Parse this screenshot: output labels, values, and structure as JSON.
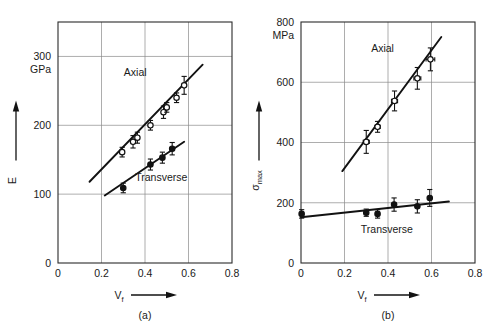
{
  "figure": {
    "background": "#ffffff",
    "ink": "#1a1a1a",
    "grid_color": "#8a8a8a"
  },
  "chart_data": [
    {
      "type": "scatter",
      "panel": "a",
      "caption": "(a)",
      "title": "",
      "xlabel": "V",
      "xlabel_sub": "f",
      "ylabel": "E",
      "ylabel_sub": "",
      "yunit": "GPa",
      "xlim": [
        0,
        0.8
      ],
      "ylim": [
        0,
        350
      ],
      "xticks": [
        0,
        0.2,
        0.4,
        0.6,
        0.8
      ],
      "xticklabels": [
        "0",
        "0.2",
        "0.4",
        "0.6",
        "0.8"
      ],
      "yticks": [
        0,
        100,
        200,
        300
      ],
      "yticklabels": [
        "0",
        "100",
        "200",
        "300"
      ],
      "grid": true,
      "legend_position": "inline-annotation",
      "series": [
        {
          "name": "Axial",
          "marker": "open-circle",
          "label_x": 0.355,
          "label_y": 272,
          "fit_x": [
            0.145,
            0.665
          ],
          "fit_y": [
            118,
            288
          ],
          "points": [
            {
              "x": 0.295,
              "y": 161,
              "yerr": 7
            },
            {
              "x": 0.345,
              "y": 176,
              "yerr": 9
            },
            {
              "x": 0.365,
              "y": 182,
              "yerr": 8
            },
            {
              "x": 0.425,
              "y": 200,
              "yerr": 7
            },
            {
              "x": 0.485,
              "y": 219,
              "yerr": 9
            },
            {
              "x": 0.5,
              "y": 226,
              "yerr": 7
            },
            {
              "x": 0.545,
              "y": 240,
              "yerr": 7
            },
            {
              "x": 0.58,
              "y": 258,
              "yerr": 13
            }
          ]
        },
        {
          "name": "Transverse",
          "marker": "filled-circle",
          "label_x": 0.475,
          "label_y": 119,
          "fit_x": [
            0.215,
            0.58
          ],
          "fit_y": [
            98,
            176
          ],
          "points": [
            {
              "x": 0.3,
              "y": 109,
              "yerr": 7
            },
            {
              "x": 0.425,
              "y": 143,
              "yerr": 8
            },
            {
              "x": 0.48,
              "y": 153,
              "yerr": 8
            },
            {
              "x": 0.525,
              "y": 166,
              "yerr": 9
            }
          ]
        }
      ]
    },
    {
      "type": "scatter",
      "panel": "b",
      "caption": "(b)",
      "title": "",
      "xlabel": "V",
      "xlabel_sub": "f",
      "ylabel": "σ",
      "ylabel_sub": "max",
      "yunit": "MPa",
      "xlim": [
        0,
        0.8
      ],
      "ylim": [
        0,
        800
      ],
      "xticks": [
        0,
        0.2,
        0.4,
        0.6,
        0.8
      ],
      "xticklabels": [
        "0",
        "0.2",
        "0.4",
        "0.6",
        "0.8"
      ],
      "yticks": [
        0,
        200,
        400,
        600,
        800
      ],
      "yticklabels": [
        "0",
        "200",
        "400",
        "600",
        "800"
      ],
      "grid": true,
      "legend_position": "inline-annotation",
      "series": [
        {
          "name": "Axial",
          "marker": "open-circle",
          "label_x": 0.375,
          "label_y": 700,
          "fit_x": [
            0.19,
            0.645
          ],
          "fit_y": [
            305,
            750
          ],
          "points": [
            {
              "x": 0.3,
              "y": 402,
              "yerr": 38,
              "xerr": 0.014
            },
            {
              "x": 0.352,
              "y": 452,
              "yerr": 18,
              "xerr": 0.012
            },
            {
              "x": 0.43,
              "y": 538,
              "yerr": 33,
              "xerr": 0.014
            },
            {
              "x": 0.535,
              "y": 613,
              "yerr": 36,
              "xerr": 0.016
            },
            {
              "x": 0.595,
              "y": 676,
              "yerr": 38,
              "xerr": 0.02
            }
          ]
        },
        {
          "name": "Transverse",
          "marker": "filled-circle",
          "label_x": 0.395,
          "label_y": 100,
          "fit_x": [
            0.0,
            0.68
          ],
          "fit_y": [
            152,
            204
          ],
          "points": [
            {
              "x": 0.003,
              "y": 163,
              "yerr": 14
            },
            {
              "x": 0.3,
              "y": 167,
              "yerr": 12
            },
            {
              "x": 0.352,
              "y": 163,
              "yerr": 14
            },
            {
              "x": 0.428,
              "y": 194,
              "yerr": 22
            },
            {
              "x": 0.535,
              "y": 188,
              "yerr": 22
            },
            {
              "x": 0.592,
              "y": 216,
              "yerr": 28
            }
          ]
        }
      ]
    }
  ]
}
